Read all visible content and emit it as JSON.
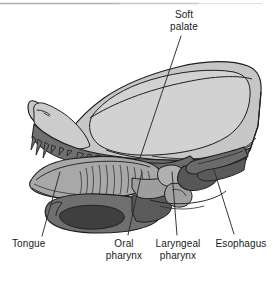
{
  "figure": {
    "background_color": "#ffffff",
    "top_rule_color": "#b6b6b6"
  },
  "palette": {
    "cranium_light": "#c6c6c6",
    "cranium_lighter": "#d2d2d2",
    "brain_case_fill": "#cfcfcf",
    "mid_gray": "#a8a8a8",
    "dark_gray": "#6f6f6f",
    "darker_gray": "#5a5a5a",
    "deep_shadow": "#3f3f3f",
    "outline": "#1f1f1f",
    "hatch_line": "#3a3a3a",
    "leader_line": "#2b2b2b",
    "text": "#1a1a1a"
  },
  "labels": [
    {
      "id": "soft-palate",
      "text": "Soft\npalate",
      "x": 158,
      "y": 9,
      "width": 52,
      "align": "center",
      "leader": {
        "x1": 181,
        "y1": 36,
        "x2": 140,
        "y2": 158
      }
    },
    {
      "id": "tongue",
      "text": "Tongue",
      "x": 12,
      "y": 238,
      "width": 50,
      "align": "left",
      "leader": {
        "x1": 42,
        "y1": 236,
        "x2": 60,
        "y2": 172
      }
    },
    {
      "id": "oral-pharynx",
      "text": "Oral\npharynx",
      "x": 100,
      "y": 238,
      "width": 48,
      "align": "center",
      "leader": {
        "x1": 128,
        "y1": 235,
        "x2": 142,
        "y2": 172
      }
    },
    {
      "id": "laryngeal-pharynx",
      "text": "Laryngeal\npharynx",
      "x": 150,
      "y": 238,
      "width": 56,
      "align": "center",
      "leader": {
        "x1": 177,
        "y1": 235,
        "x2": 172,
        "y2": 172
      }
    },
    {
      "id": "esophagus",
      "text": "Esophagus",
      "x": 210,
      "y": 238,
      "width": 62,
      "align": "center",
      "leader": {
        "x1": 234,
        "y1": 234,
        "x2": 214,
        "y2": 170
      }
    }
  ],
  "structures": [
    {
      "id": "cranium",
      "name": "cranium",
      "tone": "cranium_light"
    },
    {
      "id": "brain-case",
      "name": "brain-case",
      "tone": "cranium_lighter"
    },
    {
      "id": "nasal-region",
      "name": "nasal-region",
      "tone": "cranium_light"
    },
    {
      "id": "upper-jaw",
      "name": "upper-jaw-with-teeth",
      "tone": "dark_gray"
    },
    {
      "id": "hard-palate",
      "name": "hard-palate",
      "tone": "dark_gray"
    },
    {
      "id": "soft-palate-body",
      "name": "soft-palate",
      "tone": "dark_gray"
    },
    {
      "id": "tongue-body",
      "name": "tongue",
      "tone": "mid_gray"
    },
    {
      "id": "mandible",
      "name": "mandible",
      "tone": "dark_gray"
    },
    {
      "id": "mandible-cavity",
      "name": "mandible-cavity",
      "tone": "deep_shadow"
    },
    {
      "id": "oral-pharynx-space",
      "name": "oral-pharynx-cavity",
      "tone": "mid_gray"
    },
    {
      "id": "laryngeal-pharynx-space",
      "name": "laryngeal-pharynx-cavity",
      "tone": "darker_gray"
    },
    {
      "id": "esophagus-tube",
      "name": "esophagus",
      "tone": "dark_gray"
    },
    {
      "id": "larynx",
      "name": "larynx",
      "tone": "mid_gray"
    },
    {
      "id": "epiglottis",
      "name": "epiglottis",
      "tone": "mid_gray"
    }
  ]
}
